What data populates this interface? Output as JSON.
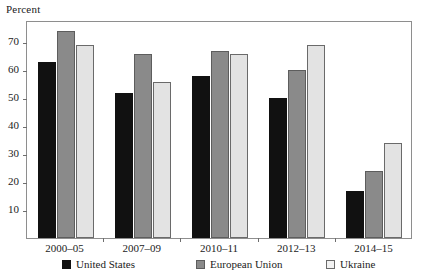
{
  "axis": {
    "unit_label": "Percent",
    "y_ticks": [
      10,
      20,
      30,
      40,
      50,
      60,
      70
    ]
  },
  "legend": [
    {
      "label": "United States",
      "key": "united-states"
    },
    {
      "label": "European Union",
      "key": "european-union"
    },
    {
      "label": "Ukraine",
      "key": "ukraine"
    }
  ],
  "colors": {
    "united_states": "#111111",
    "european_union": "#8a8a8a",
    "ukraine": "#e3e3e3",
    "frame": "#8e8e8e",
    "text": "#1b1b1b"
  },
  "chart_data": {
    "type": "bar",
    "title": "",
    "subtitle": "",
    "xlabel": "",
    "ylabel": "Percent",
    "ylim": [
      0,
      78
    ],
    "grid": false,
    "legend_position": "bottom",
    "categories": [
      "2000–05",
      "2007–09",
      "2010–11",
      "2012–13",
      "2014–15"
    ],
    "series": [
      {
        "name": "United States",
        "values": [
          63,
          52,
          58,
          50,
          17
        ]
      },
      {
        "name": "European Union",
        "values": [
          74,
          66,
          67,
          60,
          24
        ]
      },
      {
        "name": "Ukraine",
        "values": [
          69,
          56,
          66,
          69,
          34
        ]
      }
    ]
  }
}
